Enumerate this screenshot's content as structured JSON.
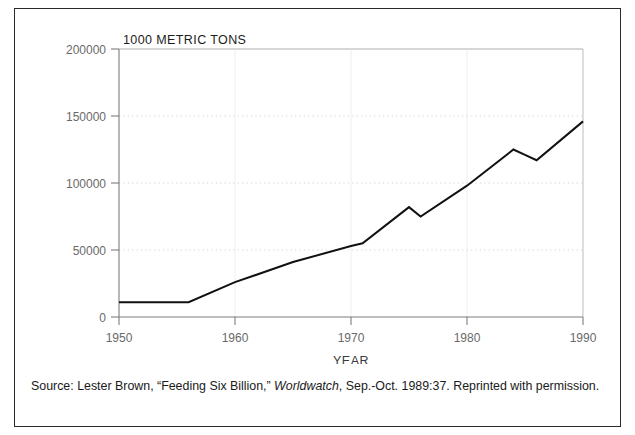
{
  "figure": {
    "caption_prefix": "Source: Lester Brown, “Feeding Six Billion,” ",
    "caption_italic": "Worldwatch",
    "caption_suffix": ", Sep.-Oct. 1989:37. Reprinted with permission.",
    "border_color": "#2b2b2b",
    "background_color": "#ffffff"
  },
  "chart_data": {
    "type": "line",
    "title": "1000 METRIC TONS",
    "xlabel": "YEAR",
    "ylabel": "",
    "xlim": [
      1950,
      1990
    ],
    "ylim": [
      0,
      200000
    ],
    "grid": true,
    "legend": "none",
    "line_color": "#111111",
    "x_ticks": [
      1950,
      1960,
      1970,
      1980,
      1990
    ],
    "x_tick_labels": [
      "1950",
      "1960",
      "1970",
      "1980",
      "1990"
    ],
    "y_ticks": [
      0,
      50000,
      100000,
      150000,
      200000
    ],
    "y_tick_labels": [
      "0",
      "50000",
      "100000",
      "150000",
      "200000"
    ],
    "series": [
      {
        "name": "World fish catch",
        "x": [
          1950,
          1956,
          1960,
          1965,
          1970,
          1971,
          1975,
          1976,
          1980,
          1984,
          1985,
          1986,
          1990
        ],
        "values": [
          11000,
          11000,
          26000,
          41000,
          53000,
          55000,
          82000,
          75000,
          98000,
          125000,
          121000,
          117000,
          146000
        ]
      }
    ]
  }
}
